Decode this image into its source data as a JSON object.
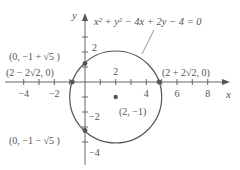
{
  "diagram": {
    "equation": "x² + y² − 4x + 2y − 4 = 0",
    "axes": {
      "x_label": "x",
      "y_label": "y",
      "x_ticks": [
        {
          "value": -4,
          "label": "−4"
        },
        {
          "value": -2,
          "label": "−2"
        },
        {
          "value": 2,
          "label": "2"
        },
        {
          "value": 4,
          "label": "4"
        },
        {
          "value": 6,
          "label": "6"
        },
        {
          "value": 8,
          "label": "8"
        }
      ],
      "y_ticks": [
        {
          "value": 2,
          "label": "2"
        },
        {
          "value": -2,
          "label": "−2"
        },
        {
          "value": -4,
          "label": "−4"
        }
      ]
    },
    "circle": {
      "center": [
        2,
        -1
      ],
      "radius": 3
    },
    "points": [
      {
        "name": "center",
        "coords": [
          2,
          -1
        ],
        "label": "(2, −1)"
      },
      {
        "name": "y-intercept-top",
        "coords": [
          0,
          1.236
        ],
        "label": "(0, −1 + √5 )"
      },
      {
        "name": "y-intercept-bottom",
        "coords": [
          0,
          -3.236
        ],
        "label": "(0, −1 − √5 )"
      },
      {
        "name": "x-intercept-left",
        "coords": [
          -0.828,
          0
        ],
        "label": "(2 − 2√2, 0)"
      },
      {
        "name": "x-intercept-right",
        "coords": [
          4.828,
          0
        ],
        "label": "(2 + 2√2, 0)"
      }
    ],
    "colors": {
      "curve": "#555555",
      "axis": "#666666",
      "point": "#555555",
      "text": "#555555"
    }
  }
}
